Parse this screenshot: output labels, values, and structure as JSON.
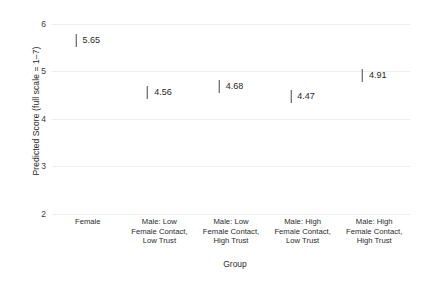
{
  "chart_data": {
    "type": "scatter",
    "title": "",
    "xlabel": "Group",
    "ylabel": "Predicted Score (full scale = 1–7)",
    "ylim": [
      2,
      6.2
    ],
    "yticks": [
      2,
      3,
      4,
      5,
      6
    ],
    "ytick_labels": [
      "2",
      "3",
      "4",
      "5",
      "6"
    ],
    "grid": true,
    "legend": "none",
    "categories": [
      "Female",
      "Male: Low Female Contact, Low Trust",
      "Male: Low Female Contact, High Trust",
      "Male: High Female Contact, Low Trust",
      "Male: High Female Contact, High Trust"
    ],
    "category_lines": [
      [
        "Female"
      ],
      [
        "Male: Low",
        "Female Contact,",
        "Low Trust"
      ],
      [
        "Male: Low",
        "Female Contact,",
        "High Trust"
      ],
      [
        "Male: High",
        "Female Contact,",
        "Low Trust"
      ],
      [
        "Male: High",
        "Female Contact,",
        "High Trust"
      ]
    ],
    "values": [
      5.65,
      4.56,
      4.68,
      4.47,
      4.91
    ],
    "value_labels": [
      "5.65",
      "4.56",
      "4.68",
      "4.47",
      "4.91"
    ],
    "marker": "vertical-tick",
    "colors": {
      "background": "#ffffff",
      "gridline": "#eeeeee",
      "marker": "#4a4a4a",
      "text": "#2b2b2b"
    }
  }
}
